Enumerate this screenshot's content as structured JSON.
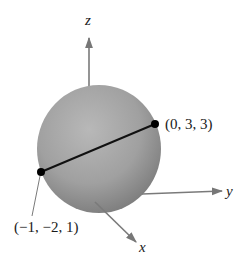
{
  "figure": {
    "axes": {
      "x": {
        "label": "x"
      },
      "y": {
        "label": "y"
      },
      "z": {
        "label": "z"
      }
    },
    "points": [
      {
        "label": "(0, 3, 3)",
        "coords": [
          0,
          3,
          3
        ]
      },
      {
        "label": "(−1, −2, 1)",
        "coords": [
          -1,
          -2,
          1
        ]
      }
    ],
    "colors": {
      "sphere_light": "#b5b5b5",
      "sphere_dark": "#7d7d7d",
      "axis": "#7a7a7a",
      "segment": "#111111",
      "point": "#000000"
    }
  }
}
